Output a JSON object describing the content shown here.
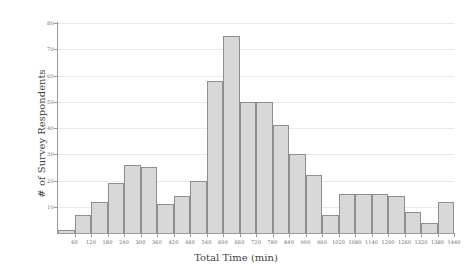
{
  "chart_data": {
    "type": "bar",
    "title": "",
    "xlabel": "Total Time (min)",
    "ylabel": "# of Survey Respondents",
    "xlim": [
      0,
      1440
    ],
    "ylim": [
      0,
      80
    ],
    "bin_width": 60,
    "grid": true,
    "legend": null,
    "bar_color": "#d8d8d8",
    "bar_edge_color": "#8e8e8e",
    "grid_color": "#e9e9e9",
    "axis_color": "#9a9a9a",
    "xticks": [
      60,
      120,
      180,
      240,
      300,
      360,
      420,
      480,
      540,
      600,
      660,
      720,
      780,
      840,
      900,
      960,
      1020,
      1080,
      1140,
      1200,
      1260,
      1320,
      1380,
      1440
    ],
    "yticks": [
      10,
      20,
      30,
      40,
      50,
      60,
      70,
      80
    ],
    "categories": [
      "0-60",
      "60-120",
      "120-180",
      "180-240",
      "240-300",
      "300-360",
      "360-420",
      "420-480",
      "480-540",
      "540-600",
      "600-660",
      "660-720",
      "720-780",
      "780-840",
      "840-900",
      "900-960",
      "960-1020",
      "1020-1080",
      "1080-1140",
      "1140-1200",
      "1200-1260",
      "1260-1320",
      "1320-1380",
      "1380-1440"
    ],
    "values": [
      1,
      7,
      12,
      19,
      26,
      25,
      11,
      14,
      20,
      58,
      75,
      50,
      50,
      41,
      30,
      22,
      7,
      15,
      15,
      15,
      14,
      8,
      4,
      12
    ]
  }
}
